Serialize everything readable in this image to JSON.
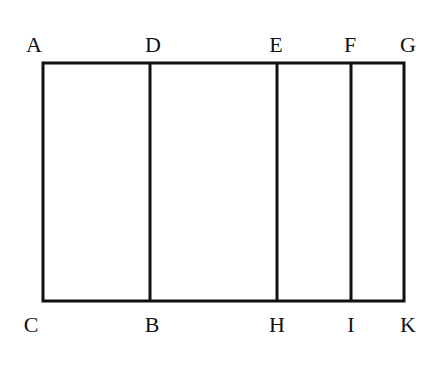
{
  "diagram": {
    "stroke_color": "#111111",
    "stroke_width": 3,
    "outer_rect": {
      "left": 43,
      "top": 63,
      "right": 404,
      "bottom": 301
    },
    "top_labels": [
      {
        "text": "A",
        "x": 34,
        "y": 52
      },
      {
        "text": "D",
        "x": 153,
        "y": 52
      },
      {
        "text": "E",
        "x": 276,
        "y": 52
      },
      {
        "text": "F",
        "x": 350,
        "y": 52
      },
      {
        "text": "G",
        "x": 408,
        "y": 52
      }
    ],
    "bottom_labels": [
      {
        "text": "C",
        "x": 31,
        "y": 332
      },
      {
        "text": "B",
        "x": 152,
        "y": 332
      },
      {
        "text": "H",
        "x": 277,
        "y": 332
      },
      {
        "text": "I",
        "x": 351,
        "y": 332
      },
      {
        "text": "K",
        "x": 408,
        "y": 332
      }
    ],
    "vertical_dividers": [
      {
        "from": "D",
        "to": "B",
        "x": 150
      },
      {
        "from": "E",
        "to": "H",
        "x": 277
      },
      {
        "from": "F",
        "to": "I",
        "x": 351
      }
    ],
    "labels": {
      "A": "A",
      "D": "D",
      "E": "E",
      "F": "F",
      "G": "G",
      "C": "C",
      "B": "B",
      "H": "H",
      "I": "I",
      "K": "K"
    }
  }
}
